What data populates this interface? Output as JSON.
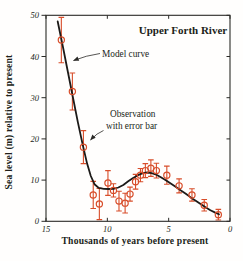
{
  "figure_title": "Upper Forth River",
  "chart_data": {
    "type": "line",
    "title": "Upper Forth River",
    "xlabel": "Thousands of years before present",
    "ylabel": "Sea level (m) relative to present",
    "xlim": [
      15,
      0
    ],
    "ylim": [
      0,
      50
    ],
    "x_ticks": [
      15,
      10,
      5,
      0
    ],
    "y_ticks": [
      0,
      10,
      20,
      30,
      40,
      50
    ],
    "grid": false,
    "legend_position": "none",
    "colors": {
      "model_curve": "#1c1a18",
      "observation": "#d84d2a",
      "frame": "#2b2a27",
      "text": "#211e19"
    },
    "annotations": [
      {
        "id": "model-curve",
        "lines": [
          "Model curve"
        ]
      },
      {
        "id": "observation",
        "lines": [
          "Observation",
          "with error bar"
        ]
      }
    ],
    "series": [
      {
        "name": "Model curve",
        "type": "line",
        "points": [
          [
            14.05,
            48.5
          ],
          [
            13.6,
            42.0
          ],
          [
            13.2,
            36.0
          ],
          [
            12.8,
            30.0
          ],
          [
            12.4,
            24.0
          ],
          [
            12.0,
            18.5
          ],
          [
            11.65,
            14.0
          ],
          [
            11.35,
            11.0
          ],
          [
            11.05,
            9.0
          ],
          [
            10.7,
            8.1
          ],
          [
            10.3,
            7.9
          ],
          [
            9.9,
            7.85
          ],
          [
            9.5,
            7.9
          ],
          [
            9.1,
            8.2
          ],
          [
            8.7,
            8.8
          ],
          [
            8.3,
            9.7
          ],
          [
            7.9,
            10.5
          ],
          [
            7.5,
            11.2
          ],
          [
            7.1,
            11.7
          ],
          [
            6.75,
            11.85
          ],
          [
            6.4,
            11.7
          ],
          [
            6.0,
            11.3
          ],
          [
            5.6,
            10.6
          ],
          [
            5.2,
            9.9
          ],
          [
            4.8,
            9.1
          ],
          [
            4.4,
            8.3
          ],
          [
            4.0,
            7.5
          ],
          [
            3.6,
            6.7
          ],
          [
            3.2,
            5.8
          ],
          [
            2.8,
            5.0
          ],
          [
            2.4,
            4.2
          ],
          [
            2.0,
            3.4
          ],
          [
            1.6,
            2.7
          ],
          [
            1.2,
            2.1
          ],
          [
            0.9,
            1.7
          ]
        ]
      },
      {
        "name": "Observation with error bar",
        "type": "scatter_with_error_bars",
        "points": [
          {
            "x": 13.75,
            "y": 44.0,
            "err": 5.5
          },
          {
            "x": 12.85,
            "y": 31.5,
            "err": 4.5
          },
          {
            "x": 11.95,
            "y": 18.0,
            "err": 4.0
          },
          {
            "x": 11.15,
            "y": 6.4,
            "err": 3.3
          },
          {
            "x": 10.65,
            "y": 4.2,
            "err": 3.8
          },
          {
            "x": 9.95,
            "y": 9.3,
            "err": 3.0
          },
          {
            "x": 9.5,
            "y": 7.5,
            "err": 1.6
          },
          {
            "x": 9.05,
            "y": 4.9,
            "err": 2.4
          },
          {
            "x": 8.55,
            "y": 4.4,
            "err": 2.4
          },
          {
            "x": 8.15,
            "y": 6.6,
            "err": 1.7
          },
          {
            "x": 7.7,
            "y": 9.6,
            "err": 1.8
          },
          {
            "x": 7.3,
            "y": 11.2,
            "err": 1.6
          },
          {
            "x": 6.9,
            "y": 12.3,
            "err": 1.7
          },
          {
            "x": 6.45,
            "y": 12.9,
            "err": 2.0
          },
          {
            "x": 6.0,
            "y": 12.3,
            "err": 1.8
          },
          {
            "x": 5.15,
            "y": 11.2,
            "err": 2.2
          },
          {
            "x": 4.15,
            "y": 8.6,
            "err": 1.7
          },
          {
            "x": 3.1,
            "y": 6.4,
            "err": 1.5
          },
          {
            "x": 2.1,
            "y": 3.9,
            "err": 1.4
          },
          {
            "x": 0.95,
            "y": 1.6,
            "err": 1.3
          }
        ]
      }
    ]
  }
}
